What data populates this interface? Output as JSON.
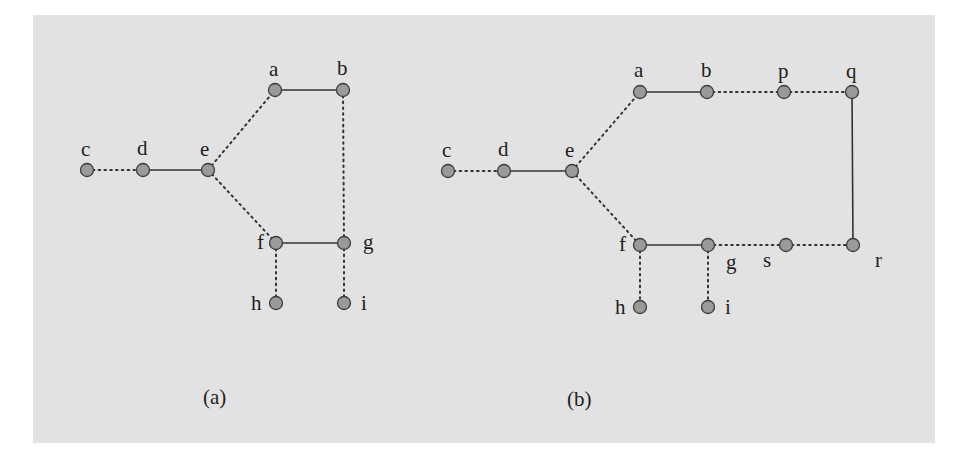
{
  "figure": {
    "background_color": "#e2e2e2",
    "node_fill": "#9a9a9a",
    "panels": [
      {
        "id": "a",
        "caption": "(a)",
        "nodes": [
          {
            "id": "c",
            "label": "c"
          },
          {
            "id": "d",
            "label": "d"
          },
          {
            "id": "e",
            "label": "e"
          },
          {
            "id": "a",
            "label": "a"
          },
          {
            "id": "b",
            "label": "b"
          },
          {
            "id": "f",
            "label": "f"
          },
          {
            "id": "g",
            "label": "g"
          },
          {
            "id": "h",
            "label": "h"
          },
          {
            "id": "i",
            "label": "i"
          }
        ],
        "edges": [
          {
            "from": "c",
            "to": "d",
            "style": "dotted"
          },
          {
            "from": "d",
            "to": "e",
            "style": "solid"
          },
          {
            "from": "e",
            "to": "a",
            "style": "dotted"
          },
          {
            "from": "e",
            "to": "f",
            "style": "dotted"
          },
          {
            "from": "a",
            "to": "b",
            "style": "solid"
          },
          {
            "from": "b",
            "to": "g",
            "style": "dotted"
          },
          {
            "from": "f",
            "to": "g",
            "style": "solid"
          },
          {
            "from": "f",
            "to": "h",
            "style": "dotted"
          },
          {
            "from": "g",
            "to": "i",
            "style": "dotted"
          }
        ]
      },
      {
        "id": "b",
        "caption": "(b)",
        "nodes": [
          {
            "id": "c",
            "label": "c"
          },
          {
            "id": "d",
            "label": "d"
          },
          {
            "id": "e",
            "label": "e"
          },
          {
            "id": "a",
            "label": "a"
          },
          {
            "id": "b",
            "label": "b"
          },
          {
            "id": "p",
            "label": "p"
          },
          {
            "id": "q",
            "label": "q"
          },
          {
            "id": "f",
            "label": "f"
          },
          {
            "id": "g",
            "label": "g"
          },
          {
            "id": "s",
            "label": "s"
          },
          {
            "id": "r",
            "label": "r"
          },
          {
            "id": "h",
            "label": "h"
          },
          {
            "id": "i",
            "label": "i"
          }
        ],
        "edges": [
          {
            "from": "c",
            "to": "d",
            "style": "dotted"
          },
          {
            "from": "d",
            "to": "e",
            "style": "solid"
          },
          {
            "from": "e",
            "to": "a",
            "style": "dotted"
          },
          {
            "from": "e",
            "to": "f",
            "style": "dotted"
          },
          {
            "from": "a",
            "to": "b",
            "style": "solid"
          },
          {
            "from": "b",
            "to": "p",
            "style": "dotted"
          },
          {
            "from": "p",
            "to": "q",
            "style": "dotted"
          },
          {
            "from": "q",
            "to": "r",
            "style": "solid"
          },
          {
            "from": "f",
            "to": "g",
            "style": "solid"
          },
          {
            "from": "g",
            "to": "s",
            "style": "dotted"
          },
          {
            "from": "s",
            "to": "r",
            "style": "dotted"
          },
          {
            "from": "f",
            "to": "h",
            "style": "dotted"
          },
          {
            "from": "g",
            "to": "i",
            "style": "dotted"
          }
        ]
      }
    ]
  }
}
